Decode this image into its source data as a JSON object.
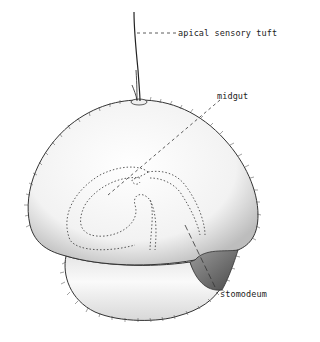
{
  "figure": {
    "labels": [
      {
        "id": "apical",
        "text": "apical sensory tuft"
      },
      {
        "id": "midgut",
        "text": "midgut"
      },
      {
        "id": "stomodeum",
        "text": "stomodeum"
      }
    ]
  },
  "colors": {
    "background": "#ffffff",
    "ink": "#222222",
    "shade": "#555555"
  }
}
